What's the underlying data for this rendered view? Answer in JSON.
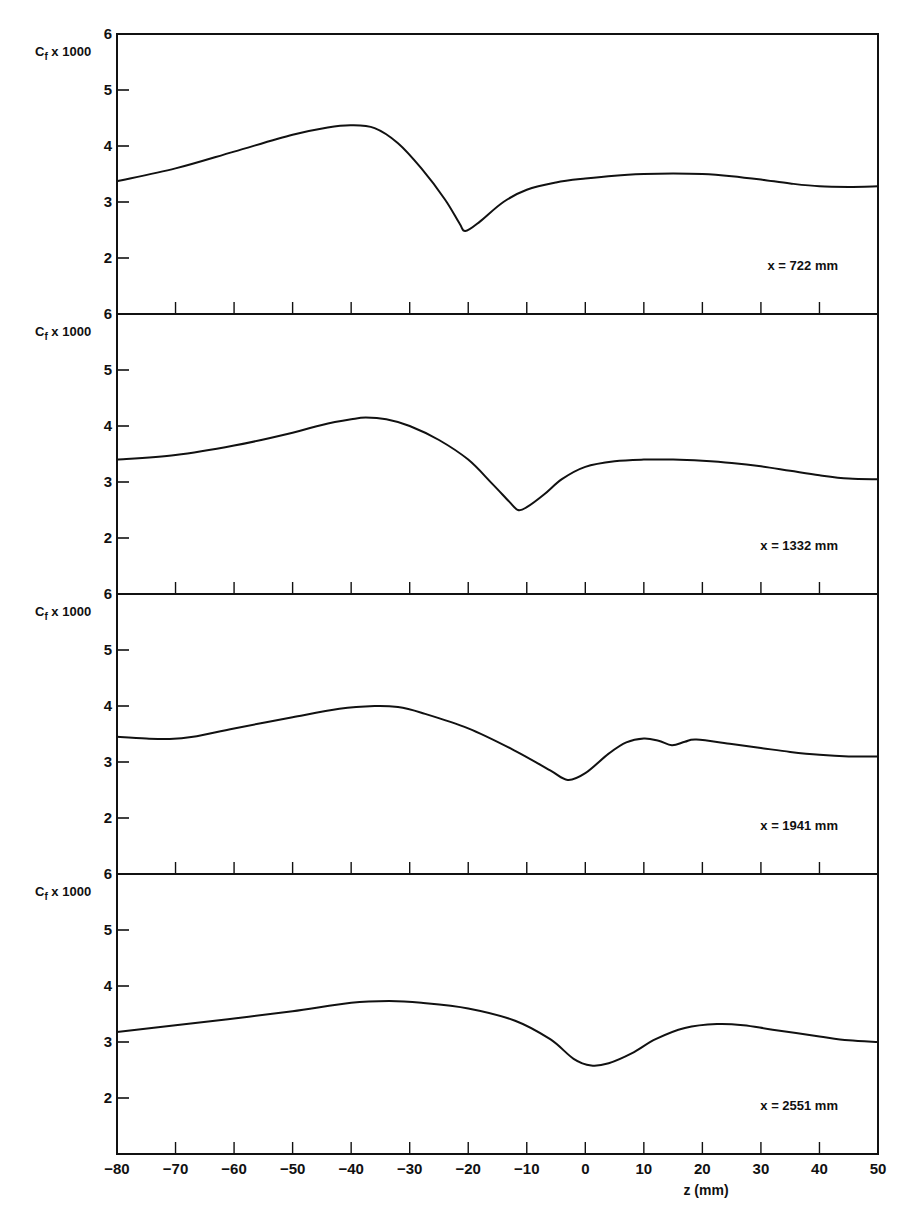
{
  "chart_data": {
    "type": "line",
    "layout": "4 vertically stacked panels sharing the z axis",
    "xlabel": "z (mm)",
    "x_ticks": [
      -80,
      -70,
      -60,
      -50,
      -40,
      -30,
      -20,
      -10,
      0,
      10,
      20,
      30,
      40,
      50
    ],
    "xlim": [
      -80,
      50
    ],
    "grid": false,
    "panels": [
      {
        "ylabel": "Cf x 1000",
        "y_ticks": [
          2,
          3,
          4,
          5,
          6
        ],
        "ylim": [
          1,
          6
        ],
        "annotation": "x = 722 mm",
        "series": {
          "name": "x = 722 mm",
          "z": [
            -80,
            -70,
            -60,
            -50,
            -44,
            -40,
            -36,
            -32,
            -28,
            -24,
            -21.5,
            -20.5,
            -18,
            -14,
            -10,
            -5,
            0,
            5,
            10,
            15,
            20,
            25,
            30,
            35,
            40,
            45,
            50
          ],
          "cf": [
            3.37,
            3.6,
            3.9,
            4.2,
            4.33,
            4.37,
            4.32,
            4.05,
            3.6,
            3.05,
            2.62,
            2.48,
            2.65,
            3.0,
            3.22,
            3.35,
            3.42,
            3.47,
            3.5,
            3.51,
            3.5,
            3.46,
            3.4,
            3.33,
            3.28,
            3.27,
            3.28
          ]
        }
      },
      {
        "ylabel": "Cf x 1000",
        "y_ticks": [
          2,
          3,
          4,
          5,
          6
        ],
        "ylim": [
          1,
          6
        ],
        "annotation": "x = 1332 mm",
        "series": {
          "name": "x = 1332 mm",
          "z": [
            -80,
            -70,
            -60,
            -50,
            -45,
            -40,
            -37.5,
            -34,
            -30,
            -25,
            -20,
            -16,
            -13,
            -11.5,
            -10,
            -7,
            -4,
            0,
            5,
            10,
            15,
            20,
            25,
            30,
            35,
            40,
            45,
            50
          ],
          "cf": [
            3.4,
            3.48,
            3.65,
            3.88,
            4.02,
            4.12,
            4.15,
            4.12,
            4.0,
            3.75,
            3.4,
            2.98,
            2.65,
            2.5,
            2.55,
            2.78,
            3.05,
            3.27,
            3.37,
            3.4,
            3.4,
            3.38,
            3.34,
            3.28,
            3.2,
            3.12,
            3.06,
            3.05
          ]
        }
      },
      {
        "ylabel": "Cf x 1000",
        "y_ticks": [
          2,
          3,
          4,
          5,
          6
        ],
        "ylim": [
          1,
          6
        ],
        "annotation": "x = 1941 mm",
        "series": {
          "name": "x = 1941 mm",
          "z": [
            -80,
            -75,
            -71,
            -67,
            -60,
            -50,
            -42,
            -36,
            -32,
            -28,
            -20,
            -12,
            -6,
            -3,
            0,
            4,
            7,
            10,
            12.5,
            14.8,
            17,
            19,
            25,
            30,
            35,
            40,
            45,
            50
          ],
          "cf": [
            3.45,
            3.42,
            3.41,
            3.45,
            3.6,
            3.8,
            3.95,
            4.0,
            3.98,
            3.88,
            3.6,
            3.2,
            2.85,
            2.68,
            2.8,
            3.15,
            3.35,
            3.42,
            3.38,
            3.3,
            3.36,
            3.4,
            3.32,
            3.25,
            3.18,
            3.13,
            3.1,
            3.1
          ]
        }
      },
      {
        "ylabel": "Cf x 1000",
        "y_ticks": [
          2,
          3,
          4,
          5,
          6
        ],
        "ylim": [
          1,
          6
        ],
        "annotation": "x = 2551 mm",
        "series": {
          "name": "x = 2551 mm",
          "z": [
            -80,
            -70,
            -60,
            -50,
            -40,
            -33.5,
            -28,
            -20,
            -12,
            -6,
            -2,
            1,
            4,
            8,
            12,
            17,
            22.5,
            27,
            32,
            40,
            45,
            50
          ],
          "cf": [
            3.18,
            3.3,
            3.42,
            3.55,
            3.7,
            3.73,
            3.7,
            3.6,
            3.38,
            3.05,
            2.7,
            2.58,
            2.62,
            2.8,
            3.05,
            3.25,
            3.32,
            3.3,
            3.22,
            3.1,
            3.03,
            3.0
          ]
        }
      }
    ]
  },
  "figure": {
    "ylabel_text": "Cf x 1000",
    "ylabel_main": "C",
    "ylabel_sub": "f",
    "ylabel_suffix": " x 1000",
    "xlabel": "z (mm)",
    "x_tick_labels": [
      "−80",
      "−70",
      "−60",
      "−50",
      "−40",
      "−30",
      "−20",
      "−10",
      "0",
      "10",
      "20",
      "30",
      "40",
      "50"
    ],
    "y_tick_labels": [
      "2",
      "3",
      "4",
      "5",
      "6"
    ],
    "panel_labels": [
      "x = 722 mm",
      "x = 1332 mm",
      "x = 1941 mm",
      "x = 2551 mm"
    ],
    "line_color": "#111111",
    "background": "#ffffff"
  }
}
